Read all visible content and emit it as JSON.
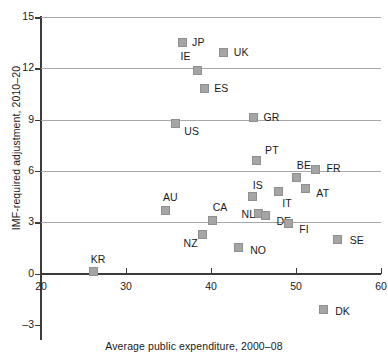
{
  "chart_data": {
    "type": "scatter",
    "title": "",
    "xlabel": "Average public expenditure, 2000–08",
    "ylabel": "IMF-required adjustment, 2010–20",
    "xlim": [
      20,
      60
    ],
    "ylim": [
      -3,
      15
    ],
    "xticks": [
      20,
      30,
      40,
      50,
      60
    ],
    "yticks": [
      -3,
      0,
      3,
      6,
      9,
      12,
      15
    ],
    "grid": "horizontal",
    "legend": "none",
    "points": [
      {
        "label": "JP",
        "x": 36.6,
        "y": 13.5,
        "lx": 10,
        "ly": -6
      },
      {
        "label": "UK",
        "x": 41.5,
        "y": 12.9,
        "lx": 10,
        "ly": -6
      },
      {
        "label": "IE",
        "x": 38.4,
        "y": 11.9,
        "lx": -17,
        "ly": -19
      },
      {
        "label": "ES",
        "x": 39.2,
        "y": 10.8,
        "lx": 10,
        "ly": -6
      },
      {
        "label": "GR",
        "x": 45.0,
        "y": 9.1,
        "lx": 10,
        "ly": -6
      },
      {
        "label": "US",
        "x": 35.8,
        "y": 8.8,
        "lx": 9,
        "ly": 3
      },
      {
        "label": "PT",
        "x": 45.3,
        "y": 6.6,
        "lx": 9,
        "ly": -16
      },
      {
        "label": "FR",
        "x": 52.3,
        "y": 6.1,
        "lx": 11,
        "ly": -6
      },
      {
        "label": "BE",
        "x": 50.1,
        "y": 5.6,
        "lx": 0,
        "ly": -18
      },
      {
        "label": "AT",
        "x": 51.1,
        "y": 5.0,
        "lx": 11,
        "ly": 0
      },
      {
        "label": "IT",
        "x": 47.9,
        "y": 4.8,
        "lx": 4,
        "ly": 7
      },
      {
        "label": "IS",
        "x": 44.9,
        "y": 4.5,
        "lx": 0,
        "ly": -17
      },
      {
        "label": "AU",
        "x": 34.7,
        "y": 3.7,
        "lx": -3,
        "ly": -18
      },
      {
        "label": "NL",
        "x": 45.6,
        "y": 3.5,
        "lx": -17,
        "ly": -5
      },
      {
        "label": "DE",
        "x": 46.4,
        "y": 3.4,
        "lx": 11,
        "ly": 1
      },
      {
        "label": "CA",
        "x": 40.2,
        "y": 3.1,
        "lx": 0,
        "ly": -18
      },
      {
        "label": "FI",
        "x": 49.1,
        "y": 2.9,
        "lx": 11,
        "ly": 0
      },
      {
        "label": "NZ",
        "x": 39.0,
        "y": 2.3,
        "lx": -19,
        "ly": 4
      },
      {
        "label": "SE",
        "x": 54.9,
        "y": 2.0,
        "lx": 12,
        "ly": -4
      },
      {
        "label": "NO",
        "x": 43.2,
        "y": 1.5,
        "lx": 12,
        "ly": -3
      },
      {
        "label": "KR",
        "x": 26.2,
        "y": 0.1,
        "lx": -3,
        "ly": -18
      },
      {
        "label": "DK",
        "x": 53.2,
        "y": -2.1,
        "lx": 12,
        "ly": -3
      }
    ]
  }
}
